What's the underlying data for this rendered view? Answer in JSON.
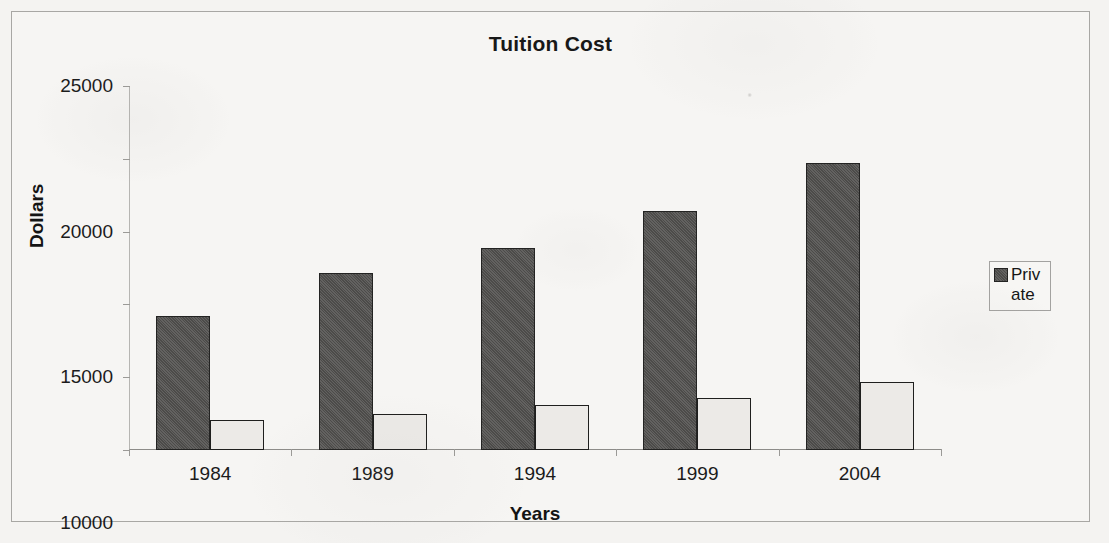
{
  "chart_data": {
    "type": "bar",
    "title": "Tuition Cost",
    "xlabel": "Years",
    "ylabel": "Dollars",
    "categories": [
      "1984",
      "1989",
      "1994",
      "1999",
      "2004"
    ],
    "series": [
      {
        "name": "Private",
        "color": "#4c4b49",
        "values": [
          9200,
          12150,
          13850,
          16400,
          19700
        ]
      },
      {
        "name": "Public",
        "color": "#eceae7",
        "values": [
          2050,
          2450,
          3100,
          3550,
          4700
        ]
      }
    ],
    "ylim": [
      0,
      25000
    ],
    "ytick_step": 5000,
    "yticks": [
      "0",
      "5000",
      "10000",
      "15000",
      "20000",
      "25000"
    ],
    "grid": false,
    "legend_position": "right",
    "legend_entries": [
      "Private"
    ]
  },
  "legend": {
    "entry_label": "Private",
    "swatch_name": "private-series-swatch"
  }
}
